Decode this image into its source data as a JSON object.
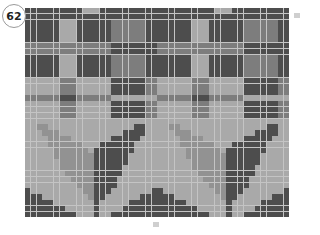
{
  "chart_number": "62",
  "labels": {
    "side_row_marker": "",
    "bottom_column_marker": ""
  },
  "grid": {
    "columns": 46,
    "rows": 36,
    "gridline_color": "#c4c4c4"
  },
  "palette": {
    "D": "#4d4d4d",
    "M": "#7d7d7d",
    "L": "#a9a9a9",
    "S": "#929292"
  },
  "motif_rows": [
    "DDDDDDDDDDLLLDDDDDDDDDD",
    "DDDDDDDDDDDDDDDDDDDDDDD",
    "DDDDDDLLLDDDDDDMMMMMMDD",
    "DDDDDDLLLDDDDDDMMMMMMDD",
    "DDDDDDLLLDDDDDDMMMMMMDD",
    "DDDDDDLLLDDDDDDMMMMMMDD",
    "MMMMMMMMMMMMMMMDDDDDDDD",
    "MMMMMMMMMMMMMMMDDDDDDDD",
    "DDDDDDLLLDDDDDDMMMMMMDD",
    "DDDDDDLLLDDDDDDMMMMMMDD",
    "DDDDDDLLLDDDDDDMMMMMMDD",
    "DDDDDDLLLDDDDDDMMMMMMDD",
    "LLLLLLMMMLLLLLLDDDDDDMM",
    "LLLLLLMMMLLLLLLDDDDDDMM",
    "LLLLLLMMMLLLLLLDDDDDDMM",
    "MMMMMMDDDMMMMMMLLLLLLLL",
    "LLLLLLMMMLLLLLLDDDDDDMM",
    "LLLLLLMMMLLLLLLDDDDDDMM",
    "LLLLLLMMMLLLLLLDDDDDDMM",
    "LLLLLLLLLLLLLLLLLLLLLLL",
    "LLSSLLLLLLLLLLLLLLLDDLL",
    "LLLSSSLLLLLLLLLLLDDDDLL",
    "LLLLSSSSLLLLLLLDDDDDLLL",
    "LLLLSSSSSSLLLDDDDDDLLLL",
    "LLLLLSSSSSSLDDDDDDDLLLL",
    "LLLLLSSSSSSSDDDDDDLLLLL",
    "LLLLLLSSSSSSDDDDDDLLLLL",
    "LLLLLLSSSSSSDDDDDLLLLLL",
    "LLLLLLLSSSSSDDDDDLLLLLL",
    "LLLLLLLLSSSSDDDDLLLLLLL",
    "LLLLLLLLLSSSDDDDLLLLLLL",
    "DLLLLLLLLLSSDDDLLLLLLLD",
    "DDDLLLLLLLLSDDLLLLLLDDD",
    "DDDDDLLLLLLLDLLLLLDDDDD",
    "DDDDDDDLLLLLDLLLLDDDDDD",
    "DDDDDDDDDLLLDLLDDDDDDDD"
  ],
  "repeat_count": 2
}
